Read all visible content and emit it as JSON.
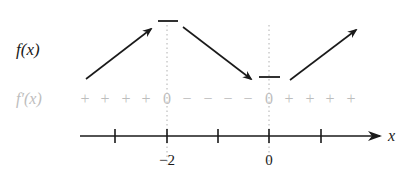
{
  "diagram": {
    "row_labels": {
      "f": "f(x)",
      "fprime": "f′(x)"
    },
    "sign_chart": [
      "+",
      "+",
      "+",
      "+",
      "0",
      "−",
      "−",
      "−",
      "−",
      "0",
      "+",
      "+",
      "+",
      "+"
    ],
    "axis": {
      "variable": "x",
      "tick_labels": [
        "−2",
        "0"
      ]
    },
    "colors": {
      "ink": "#1a1a1a",
      "faded": "#bdbdbd",
      "dotted": "#b0b0b0"
    }
  }
}
